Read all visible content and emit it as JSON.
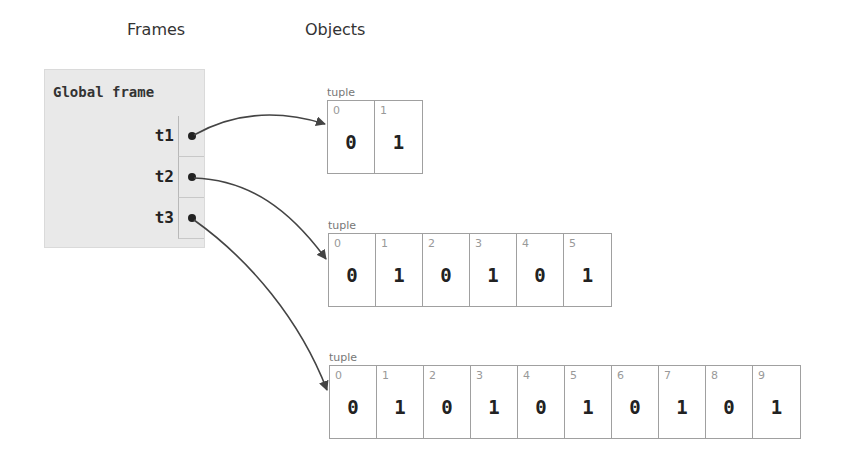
{
  "headers": {
    "frames": "Frames",
    "objects": "Objects"
  },
  "frame": {
    "title": "Global frame",
    "variables": [
      {
        "name": "t1",
        "points_to": 0
      },
      {
        "name": "t2",
        "points_to": 1
      },
      {
        "name": "t3",
        "points_to": 2
      }
    ]
  },
  "objects": [
    {
      "type": "tuple",
      "indices": [
        "0",
        "1"
      ],
      "values": [
        "0",
        "1"
      ]
    },
    {
      "type": "tuple",
      "indices": [
        "0",
        "1",
        "2",
        "3",
        "4",
        "5"
      ],
      "values": [
        "0",
        "1",
        "0",
        "1",
        "0",
        "1"
      ]
    },
    {
      "type": "tuple",
      "indices": [
        "0",
        "1",
        "2",
        "3",
        "4",
        "5",
        "6",
        "7",
        "8",
        "9"
      ],
      "values": [
        "0",
        "1",
        "0",
        "1",
        "0",
        "1",
        "0",
        "1",
        "0",
        "1"
      ]
    }
  ],
  "colors": {
    "frame_bg": "#e9e9e9",
    "arrow": "#444444",
    "cell_border": "#a0a0a0"
  }
}
